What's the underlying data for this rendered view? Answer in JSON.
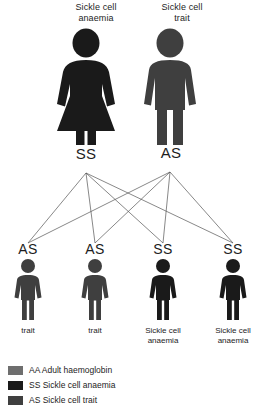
{
  "diagram": {
    "title_role": "sickle-cell-inheritance-pedigree",
    "colors": {
      "aa_adult_haemoglobin": "#6e6e6e",
      "ss_sickle_cell_anaemia": "#1a1a1a",
      "as_sickle_cell_trait": "#3f3f3f",
      "line": "#555555",
      "background": "#ffffff"
    }
  },
  "parents": [
    {
      "caption_line1": "Sickle cell",
      "caption_line2": "anaemia",
      "genotype": "SS",
      "sex": "female",
      "color": "#1a1a1a"
    },
    {
      "caption_line1": "Sickle cell",
      "caption_line2": "trait",
      "genotype": "AS",
      "sex": "male",
      "color": "#3f3f3f"
    }
  ],
  "children": [
    {
      "genotype": "AS",
      "caption_line1": "trait",
      "caption_line2": "",
      "sex": "male",
      "color": "#3f3f3f"
    },
    {
      "genotype": "AS",
      "caption_line1": "trait",
      "caption_line2": "",
      "sex": "male",
      "color": "#3f3f3f"
    },
    {
      "genotype": "SS",
      "caption_line1": "Sickle cell",
      "caption_line2": "anaemia",
      "sex": "male",
      "color": "#1a1a1a"
    },
    {
      "genotype": "SS",
      "caption_line1": "Sickle cell",
      "caption_line2": "anaemia",
      "sex": "male",
      "color": "#1a1a1a"
    }
  ],
  "legend": [
    {
      "code": "AA",
      "label": "AA Adult haemoglobin",
      "color": "#6e6e6e"
    },
    {
      "code": "SS",
      "label": "SS Sickle cell anaemia",
      "color": "#1a1a1a"
    },
    {
      "code": "AS",
      "label": "AS Sickle cell trait",
      "color": "#3f3f3f"
    }
  ]
}
